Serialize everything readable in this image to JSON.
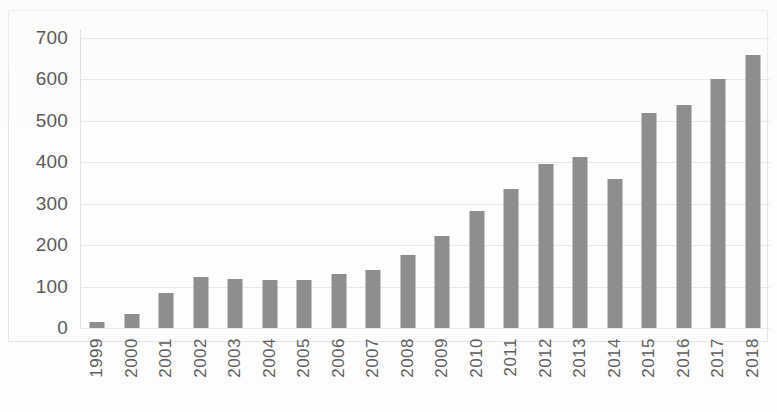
{
  "chart_data": {
    "type": "bar",
    "title": "",
    "subtitle": "",
    "xlabel": "",
    "ylabel": "",
    "categories": [
      "1999",
      "2000",
      "2001",
      "2002",
      "2003",
      "2004",
      "2005",
      "2006",
      "2007",
      "2008",
      "2009",
      "2010",
      "2011",
      "2012",
      "2013",
      "2014",
      "2015",
      "2016",
      "2017",
      "2018"
    ],
    "values": [
      15,
      34,
      85,
      122,
      118,
      115,
      117,
      130,
      140,
      176,
      222,
      283,
      336,
      397,
      412,
      360,
      519,
      539,
      601,
      659
    ],
    "series": [
      {
        "name": "",
        "values": [
          15,
          34,
          85,
          122,
          118,
          115,
          117,
          130,
          140,
          176,
          222,
          283,
          336,
          397,
          412,
          360,
          519,
          539,
          601,
          659
        ]
      }
    ],
    "ylim": [
      0,
      700
    ],
    "y_ticks": [
      0,
      100,
      200,
      300,
      400,
      500,
      600,
      700
    ],
    "y_tick_labels": [
      "0",
      "100",
      "200",
      "300",
      "400",
      "500",
      "600",
      "700"
    ],
    "x_tick_labels": [
      "1999",
      "2000",
      "2001",
      "2002",
      "2003",
      "2004",
      "2005",
      "2006",
      "2007",
      "2008",
      "2009",
      "2010",
      "2011",
      "2012",
      "2013",
      "2014",
      "2015",
      "2016",
      "2017",
      "2018"
    ],
    "grid": true,
    "grid_axis": "y",
    "legend": false,
    "legend_position": "none",
    "annotations": [],
    "colors": {
      "bar": "#8e8e8e",
      "gridline": "#e8e8e8",
      "axis": "#d9d9d9",
      "tick_text": "#5a5a5a",
      "frame": "#e3e3e3",
      "background": "#fdfdfd"
    }
  }
}
